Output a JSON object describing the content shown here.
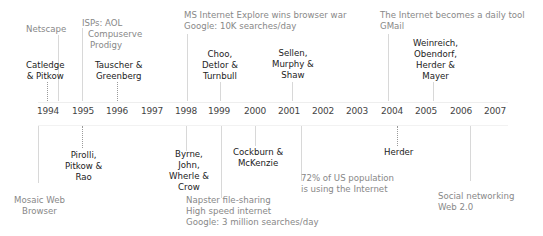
{
  "years": [
    "1994",
    "1995",
    "1996",
    "1997",
    "1998",
    "1999",
    "2000",
    "2001",
    "2002",
    "2003",
    "2004",
    "2005",
    "2006",
    "2007"
  ],
  "above": {
    "authors": [
      {
        "year": "1994",
        "lines": [
          "Catledge",
          "& Pitkow"
        ]
      },
      {
        "year": "1996",
        "lines": [
          "Tauscher &",
          "Greenberg"
        ]
      },
      {
        "year": "1999",
        "lines": [
          "Choo,",
          "Detlor &",
          "Turnbull"
        ]
      },
      {
        "year": "2001",
        "lines": [
          "Sellen,",
          "Murphy &",
          "Shaw"
        ]
      },
      {
        "year": "2005",
        "lines": [
          "Weinreich,",
          "Obendorf,",
          "Herder &",
          "Mayer"
        ]
      }
    ],
    "events": [
      {
        "year": "1994",
        "lines": [
          "Netscape"
        ]
      },
      {
        "year": "1995",
        "lines": [
          "ISPs: AOL",
          "Compuserve",
          "Prodigy"
        ]
      },
      {
        "year": "1998",
        "lines": [
          "MS Internet Explore wins browser war",
          "Google: 10K searches/day"
        ]
      },
      {
        "year": "2004",
        "lines": [
          "The Internet becomes a daily tool",
          "GMail"
        ]
      }
    ]
  },
  "below": {
    "authors": [
      {
        "year": "1995",
        "lines": [
          "Pirolli,",
          "Pitkow &",
          "Rao"
        ]
      },
      {
        "year": "1998",
        "lines": [
          "Byrne,",
          "John,",
          "Wherle &",
          "Crow"
        ]
      },
      {
        "year": "2000",
        "lines": [
          "Cockburn &",
          "McKenzie"
        ]
      },
      {
        "year": "2004",
        "lines": [
          "Herder"
        ]
      }
    ],
    "events": [
      {
        "year": "1994",
        "lines": [
          "Mosaic Web",
          "Browser"
        ]
      },
      {
        "year": "1999",
        "lines": [
          "Napster file-sharing",
          "High speed internet",
          "Google: 3 million searches/day"
        ]
      },
      {
        "year": "2001",
        "lines": [
          "72% of US population",
          "is using the Internet"
        ]
      },
      {
        "year": "2006",
        "lines": [
          "Social networking",
          "Web 2.0"
        ]
      }
    ]
  }
}
